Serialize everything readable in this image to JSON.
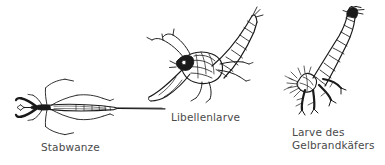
{
  "illustration": {
    "title": "Wasserinsekten - Larven und Wanzen",
    "background_color": "#ffffff",
    "ink_color": "#1a1a1a",
    "caption_color": "#4a4a4a",
    "figures": [
      {
        "id": "stabwanze",
        "caption": "Stabwanze",
        "icon_name": "water-stick-insect-drawing",
        "position": "left",
        "description": "Dorsal view of a water stick insect with long slender body, six splayed legs and a long thin breathing siphon extending to the right"
      },
      {
        "id": "libellenlarve",
        "caption": "Libellenlarve",
        "icon_name": "dragonfly-larva-drawing",
        "position": "center",
        "description": "Dragonfly nymph with segmented upward-curving abdomen and extended labial mask"
      },
      {
        "id": "gelbrandkaefer-larve",
        "caption": "Larve des\nGelbrandkäfers",
        "icon_name": "diving-beetle-larva-drawing",
        "position": "right",
        "description": "Great diving beetle larva with segmented tapering abdomen curving upward, bristly legs and large sickle mandibles"
      }
    ]
  }
}
